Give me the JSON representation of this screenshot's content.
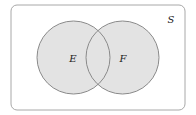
{
  "diagram": {
    "type": "venn",
    "universe": {
      "label": "S",
      "x": 11,
      "y": 5,
      "width": 174,
      "height": 105,
      "radius": 6,
      "fill": "#ffffff",
      "stroke": "#a8a8a8"
    },
    "sets": [
      {
        "label": "E",
        "cx": 73.5,
        "cy": 57.5,
        "r": 36.5
      },
      {
        "label": "F",
        "cx": 122.5,
        "cy": 57.5,
        "r": 36.5
      }
    ],
    "colors": {
      "circle_fill": "#e3e3e3",
      "circle_stroke": "#8a8a8a",
      "text": "#222222"
    }
  }
}
